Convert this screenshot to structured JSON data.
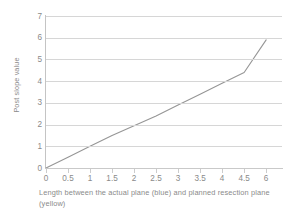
{
  "chart_data": {
    "type": "line",
    "title": "",
    "xlabel": "Length between the actual plane (blue) and planned resection plane (yellow)",
    "ylabel": "Post slope value",
    "grid": true,
    "legend": "none",
    "xlim": [
      0,
      6
    ],
    "ylim": [
      0,
      7
    ],
    "x_tick_labels": [
      "0",
      "0.5",
      "1",
      "1.5",
      "2",
      "2.5",
      "3",
      "3.5",
      "4",
      "4.5",
      "6"
    ],
    "y_tick_labels": [
      "0",
      "1",
      "2",
      "3",
      "4",
      "5",
      "6",
      "7"
    ],
    "series": [
      {
        "name": "post slope",
        "x": [
          0,
          0.5,
          1,
          1.5,
          2,
          2.5,
          3,
          3.5,
          4,
          4.5,
          6
        ],
        "values": [
          0,
          0.5,
          1.0,
          1.5,
          1.95,
          2.4,
          2.9,
          3.4,
          3.9,
          4.4,
          5.9
        ],
        "color": "#969696"
      }
    ]
  },
  "axes": {
    "y_title": "Post slope value",
    "x_title_line1": "Length between the actual plane (blue) and planned resection plane",
    "x_title_line2": "(yellow)"
  }
}
